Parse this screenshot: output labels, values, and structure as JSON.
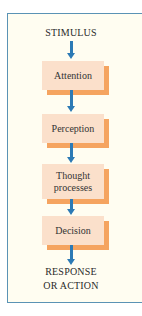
{
  "diagram": {
    "type": "flowchart",
    "direction": "top-to-bottom",
    "start_label": "STIMULUS",
    "steps": [
      {
        "label": "Attention"
      },
      {
        "label": "Perception"
      },
      {
        "label": "Thought processes",
        "line1": "Thought",
        "line2": "processes"
      },
      {
        "label": "Decision"
      }
    ],
    "end_label_line1": "RESPONSE",
    "end_label_line2": "OR ACTION",
    "colors": {
      "frame_border": "#5a93b5",
      "frame_background": "#fffdf1",
      "box_fill": "#fbe0cb",
      "box_shadow": "#f5a460",
      "arrow": "#2c7ab5"
    }
  }
}
